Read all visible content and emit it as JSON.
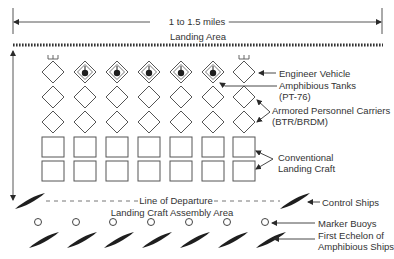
{
  "diagram": {
    "width_label": "1 to 1.5 miles",
    "landing_area_label": "Landing Area",
    "line_of_departure_label": "Line of Departure",
    "assembly_area_label": "Landing Craft Assembly Area"
  },
  "legend": {
    "engineer_vehicle": "Engineer Vehicle",
    "amphibious_tanks_line1": "Amphibious Tanks",
    "amphibious_tanks_line2": "(PT-76)",
    "apc_line1": "Armored Personnel Carriers",
    "apc_line2": "(BTR/BRDM)",
    "landing_craft_line1": "Conventional",
    "landing_craft_line2": "Landing Craft",
    "control_ships": "Control Ships",
    "marker_buoys": "Marker Buoys",
    "first_echelon_line1": "First Echelon of",
    "first_echelon_line2": "Amphibious Ships"
  },
  "formation": {
    "columns": [
      53,
      85,
      117,
      149,
      181,
      213,
      244
    ],
    "rows": [
      {
        "type": "front-row",
        "units": [
          "engineer",
          "tank",
          "tank",
          "tank",
          "tank",
          "tank",
          "engineer"
        ],
        "y": 72
      },
      {
        "type": "apc",
        "y": 97
      },
      {
        "type": "apc",
        "y": 122
      },
      {
        "type": "landing-craft",
        "y": 147
      },
      {
        "type": "landing-craft",
        "y": 171
      }
    ],
    "buoys_x": [
      38,
      76,
      113,
      151,
      189,
      227,
      265
    ],
    "ships_x": [
      44,
      82,
      119,
      157,
      195,
      233,
      271
    ],
    "control_ships_x": [
      30,
      295
    ]
  },
  "colors": {
    "ink": "#2a2a2a",
    "ship_fill": "#1e1e1e",
    "background": "#ffffff"
  }
}
